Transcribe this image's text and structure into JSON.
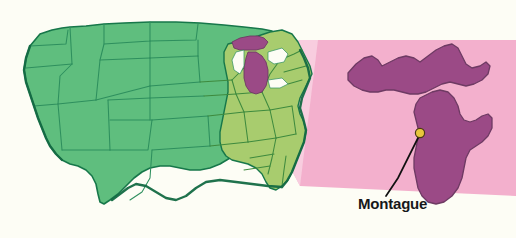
{
  "figure": {
    "kind": "locator-map",
    "background_color": "#FDFDF5",
    "width": 516,
    "height": 238
  },
  "main_map": {
    "name": "contiguous-united-states",
    "land_color_west": "#5FBE7E",
    "land_color_east": "#A8CC6E",
    "border_color": "#1A7A4C",
    "coast_color": "#17774A",
    "highlight_state": "Michigan",
    "highlight_color": "#9B4A86"
  },
  "inset": {
    "name": "michigan-inset",
    "state": "Michigan",
    "fill_color": "#9B4A86",
    "stroke_color": "#6E3A63",
    "wedge_color": "#F2A9C9",
    "wedge_color_light": "#F7CBDD"
  },
  "marker": {
    "label": "Montague",
    "dot_color": "#E8C73C",
    "dot_edge_color": "#3A3010",
    "leader_color": "#101010",
    "dot_x": 420,
    "dot_y": 133
  },
  "labels": {
    "montague": "Montague"
  }
}
